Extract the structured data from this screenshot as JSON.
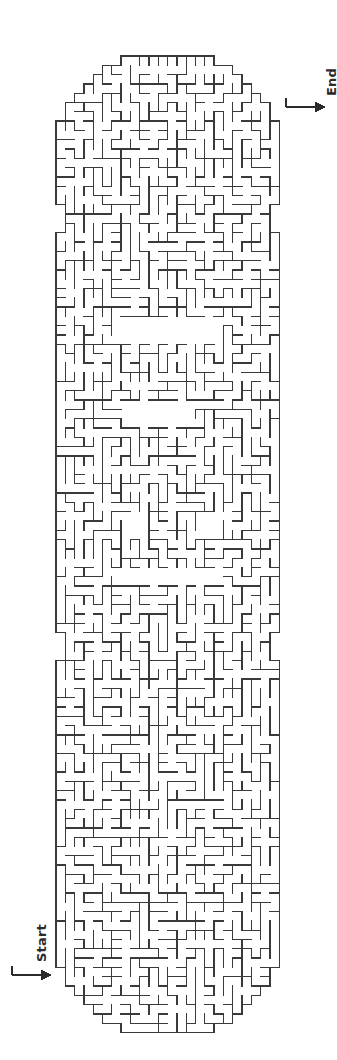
{
  "page": {
    "background_color": "#ffffff",
    "wall_color": "#3a3a3a",
    "wall_width": 1.3,
    "width": 337,
    "height": 1060
  },
  "maze": {
    "shape": "rounded-rectangle-capsule",
    "orientation": "vertical",
    "cell_size": 9.3,
    "columns": 24,
    "rows": 105,
    "origin_x": 56,
    "origin_y": 56,
    "open_chambers": [
      {
        "name": "upper-chamber",
        "x": 114,
        "y": 318,
        "w": 103,
        "h": 28
      },
      {
        "name": "mid-upper-chamber",
        "x": 123,
        "y": 402,
        "w": 66,
        "h": 28
      },
      {
        "name": "small-chamber-left",
        "x": 121,
        "y": 512,
        "w": 28,
        "h": 28
      },
      {
        "name": "small-chamber-right",
        "x": 196,
        "y": 512,
        "w": 28,
        "h": 28
      },
      {
        "name": "lower-chamber",
        "x": 114,
        "y": 568,
        "w": 103,
        "h": 19
      }
    ]
  },
  "entrance": {
    "label": "Start",
    "arrow_direction": "right",
    "arrow_x": 12,
    "arrow_y": 975,
    "arrow_length": 38,
    "icon": "arrow-right-icon"
  },
  "exit": {
    "label": "End",
    "arrow_direction": "right",
    "arrow_x": 286,
    "arrow_y": 107,
    "arrow_length": 38,
    "icon": "arrow-right-icon"
  }
}
